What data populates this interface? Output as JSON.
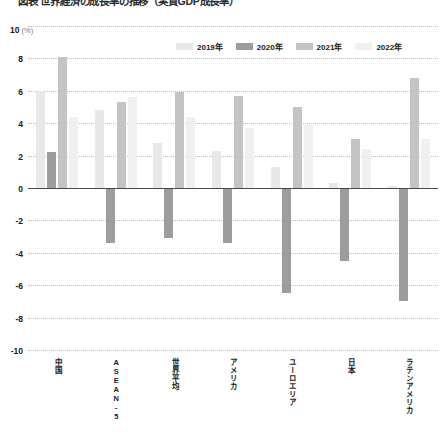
{
  "title": "図表 世界経済の成長率の推移（実質GDP成長率）",
  "axis_unit": {
    "value": "10",
    "unit": "(%)"
  },
  "legend": {
    "position": "top-right",
    "items": [
      {
        "label": "2019年",
        "color": "#e8e8e8"
      },
      {
        "label": "2020年",
        "color": "#9d9d9d"
      },
      {
        "label": "2021年",
        "color": "#c4c4c4"
      },
      {
        "label": "2022年",
        "color": "#f0f0f0"
      }
    ]
  },
  "chart_data": {
    "type": "bar",
    "title": "図表 世界経済の成長率の推移（実質GDP成長率）",
    "xlabel": "",
    "ylabel": "(%)",
    "ylim": [
      -10,
      10
    ],
    "yticks": [
      "10",
      "8",
      "6",
      "4",
      "2",
      "0",
      "-2",
      "-4",
      "-6",
      "-8",
      "-10"
    ],
    "ytick_values": [
      10,
      8,
      6,
      4,
      2,
      0,
      -2,
      -4,
      -6,
      -8,
      -10
    ],
    "grid": true,
    "legend_position": "top-right",
    "categories": [
      "中国",
      "ASEAN-5",
      "世界平均",
      "アメリカ",
      "ユーロエリア",
      "日本",
      "ラテンアメリカ"
    ],
    "series": [
      {
        "name": "2019年",
        "color": "#e8e8e8",
        "values": [
          6.0,
          4.8,
          2.8,
          2.3,
          1.3,
          0.3,
          0.1
        ]
      },
      {
        "name": "2020年",
        "color": "#9d9d9d",
        "values": [
          2.2,
          -3.4,
          -3.1,
          -3.4,
          -6.5,
          -4.5,
          -7.0
        ]
      },
      {
        "name": "2021年",
        "color": "#c4c4c4",
        "values": [
          8.1,
          5.3,
          5.9,
          5.7,
          5.0,
          3.0,
          6.8
        ]
      },
      {
        "name": "2022年",
        "color": "#f0f0f0",
        "values": [
          4.4,
          5.6,
          4.4,
          3.7,
          3.9,
          2.4,
          3.0
        ]
      }
    ]
  }
}
